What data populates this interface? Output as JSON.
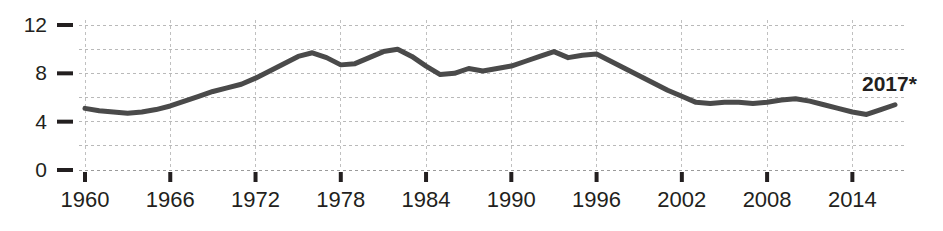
{
  "chart_data": {
    "type": "line",
    "title": "",
    "subtitle": "",
    "xlabel": "",
    "ylabel": "",
    "xlim": [
      1960,
      2017
    ],
    "ylim": [
      0,
      12
    ],
    "grid": true,
    "legend_position": "none",
    "y_ticks": [
      0,
      4,
      8,
      12
    ],
    "y_tick_labels": [
      "0",
      "4",
      "8",
      "12"
    ],
    "y_gridlines": [
      0,
      2,
      4,
      6,
      8,
      10,
      12
    ],
    "x_ticks": [
      1960,
      1966,
      1972,
      1978,
      1984,
      1990,
      1996,
      2002,
      2008,
      2014
    ],
    "x_tick_labels": [
      "1960",
      "1966",
      "1972",
      "1978",
      "1984",
      "1990",
      "1996",
      "2002",
      "2008",
      "2014"
    ],
    "annotations": [
      {
        "name": "end-point-label",
        "text": "2017*",
        "x": 2017,
        "y": 5.4
      }
    ],
    "series": [
      {
        "name": "value",
        "color": "#4a4a4a",
        "x": [
          1960,
          1961,
          1962,
          1963,
          1964,
          1965,
          1966,
          1967,
          1968,
          1969,
          1970,
          1971,
          1972,
          1973,
          1974,
          1975,
          1976,
          1977,
          1978,
          1979,
          1980,
          1981,
          1982,
          1983,
          1984,
          1985,
          1986,
          1987,
          1988,
          1989,
          1990,
          1991,
          1992,
          1993,
          1994,
          1995,
          1996,
          1997,
          1998,
          1999,
          2000,
          2001,
          2002,
          2003,
          2004,
          2005,
          2006,
          2007,
          2008,
          2009,
          2010,
          2011,
          2012,
          2013,
          2014,
          2015,
          2016,
          2017
        ],
        "values": [
          5.1,
          4.9,
          4.8,
          4.7,
          4.8,
          5.0,
          5.3,
          5.7,
          6.1,
          6.5,
          6.8,
          7.1,
          7.6,
          8.2,
          8.8,
          9.4,
          9.7,
          9.3,
          8.7,
          8.8,
          9.3,
          9.8,
          10.0,
          9.4,
          8.6,
          7.9,
          8.0,
          8.4,
          8.2,
          8.4,
          8.6,
          9.0,
          9.4,
          9.8,
          9.3,
          9.5,
          9.6,
          9.0,
          8.4,
          7.8,
          7.2,
          6.6,
          6.1,
          5.6,
          5.5,
          5.6,
          5.6,
          5.5,
          5.6,
          5.8,
          5.9,
          5.7,
          5.4,
          5.1,
          4.8,
          4.6,
          5.0,
          5.4
        ]
      }
    ]
  }
}
